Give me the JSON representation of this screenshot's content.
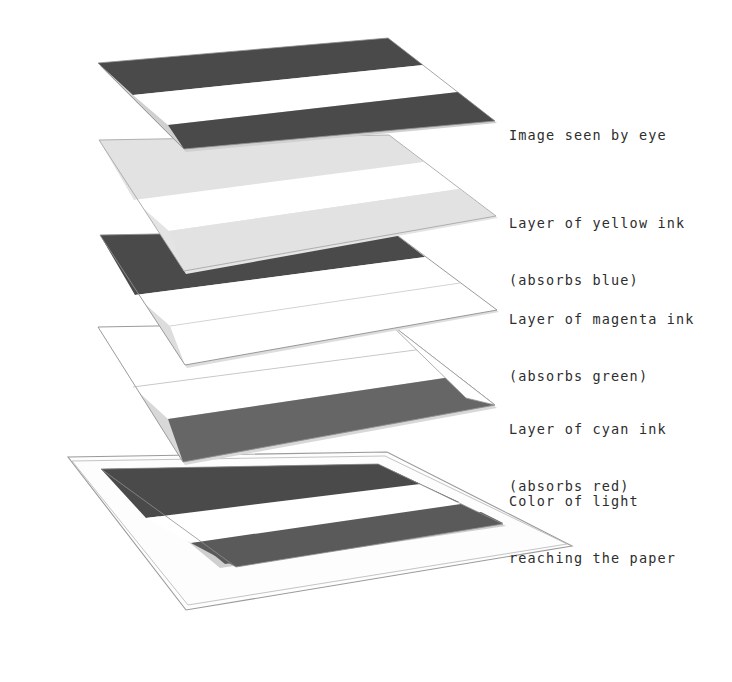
{
  "figure": {
    "background_color": "#ffffff",
    "text_color": "#2d2d2d",
    "outline_color": "#8a8a8a"
  },
  "palette": {
    "dark_band": "#4a4a4a",
    "mid_band": "#666666",
    "light_band": "#e2e2e2",
    "white_band": "#ffffff",
    "sheet_white": "#fdfdfd",
    "edge_line": "#8f8f8f",
    "thin_line": "#b0b0b0",
    "shadow": "#c9c9c9"
  },
  "layers": [
    {
      "id": "image-seen-by-eye",
      "label_lines": [
        "Image seen by eye"
      ],
      "bands": [
        {
          "name": "band-top",
          "color": "#4a4a4a"
        },
        {
          "name": "band-middle",
          "color": "#ffffff"
        },
        {
          "name": "band-bottom",
          "color": "#4a4a4a"
        }
      ]
    },
    {
      "id": "yellow-ink",
      "label_lines": [
        "Layer of yellow ink",
        "(absorbs blue)"
      ],
      "bands": [
        {
          "name": "band-top",
          "color": "#e2e2e2"
        },
        {
          "name": "band-middle",
          "color": "#ffffff"
        },
        {
          "name": "band-bottom",
          "color": "#e2e2e2"
        }
      ]
    },
    {
      "id": "magenta-ink",
      "label_lines": [
        "Layer of magenta ink",
        "(absorbs green)"
      ],
      "bands": [
        {
          "name": "band-top",
          "color": "#4a4a4a"
        },
        {
          "name": "band-middle",
          "color": "#ffffff"
        },
        {
          "name": "band-bottom",
          "color": "#ffffff"
        }
      ]
    },
    {
      "id": "cyan-ink",
      "label_lines": [
        "Layer of cyan ink",
        "(absorbs red)"
      ],
      "bands": [
        {
          "name": "band-top",
          "color": "#ffffff"
        },
        {
          "name": "band-middle",
          "color": "#ffffff"
        },
        {
          "name": "band-bottom",
          "color": "#666666"
        }
      ]
    },
    {
      "id": "paper",
      "label_lines": [
        "Color of light",
        "reaching the paper"
      ],
      "bands": [
        {
          "name": "band-top",
          "color": "#4a4a4a"
        },
        {
          "name": "band-middle",
          "color": "#ffffff"
        },
        {
          "name": "band-bottom",
          "color": "#5a5a5a"
        }
      ]
    }
  ],
  "labels": {
    "image_seen_by_eye": "Image seen by eye",
    "yellow_line1": "Layer of yellow ink",
    "yellow_line2": "(absorbs blue)",
    "magenta_line1": "Layer of magenta ink",
    "magenta_line2": "(absorbs green)",
    "cyan_line1": "Layer of cyan ink",
    "cyan_line2": "(absorbs red)",
    "paper_line1": "Color of light",
    "paper_line2": "reaching the paper"
  }
}
